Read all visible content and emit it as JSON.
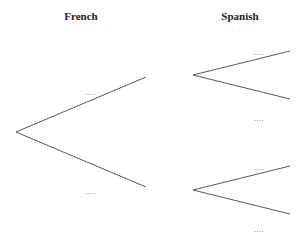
{
  "headers": {
    "left": "French",
    "right": "Spanish"
  },
  "trees": [
    {
      "name": "french-tree",
      "root": [
        16,
        132
      ],
      "branches": [
        {
          "end": [
            146,
            77
          ],
          "label": "....",
          "label_pos": [
            90,
            95
          ]
        },
        {
          "end": [
            146,
            187
          ],
          "label": "....",
          "label_pos": [
            90,
            194
          ]
        }
      ]
    },
    {
      "name": "spanish-tree-upper",
      "root": [
        193,
        75
      ],
      "branches": [
        {
          "end": [
            290,
            51
          ],
          "label": "....",
          "label_pos": [
            259,
            55
          ]
        },
        {
          "end": [
            290,
            99
          ],
          "label": "....",
          "label_pos": [
            259,
            121
          ]
        }
      ]
    },
    {
      "name": "spanish-tree-lower",
      "root": [
        193,
        190
      ],
      "branches": [
        {
          "end": [
            290,
            166
          ],
          "label": "....",
          "label_pos": [
            259,
            170
          ]
        },
        {
          "end": [
            290,
            214
          ],
          "label": "....",
          "label_pos": [
            259,
            232
          ]
        }
      ]
    }
  ]
}
